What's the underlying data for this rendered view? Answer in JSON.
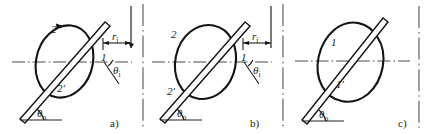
{
  "figure": {
    "title": "",
    "background_color": "#ffffff",
    "line_color": "#141414",
    "centerline_color": "#4a4a4a",
    "panels": [
      {
        "id": "a",
        "panel_label": "a)",
        "labels": {
          "curve_outer": "2",
          "curve_inner": "2'",
          "intersection": "1",
          "radius": "r",
          "radius_sub": "i",
          "angle_incline": "θ",
          "angle_incline_sub": "i",
          "angle_base": "θ",
          "angle_base_sub": "o"
        }
      },
      {
        "id": "b",
        "panel_label": "b)",
        "labels": {
          "curve_outer": "2",
          "curve_inner": "2'",
          "intersection": "1",
          "radius": "r",
          "radius_sub": "i",
          "angle_incline": "θ",
          "angle_incline_sub": "i",
          "angle_base": "θ",
          "angle_base_sub": "o"
        }
      },
      {
        "id": "c",
        "panel_label": "c)",
        "labels": {
          "curve_outer": "1",
          "curve_inner": "1'",
          "angle_base": "θ",
          "angle_base_sub": "o"
        }
      }
    ]
  }
}
